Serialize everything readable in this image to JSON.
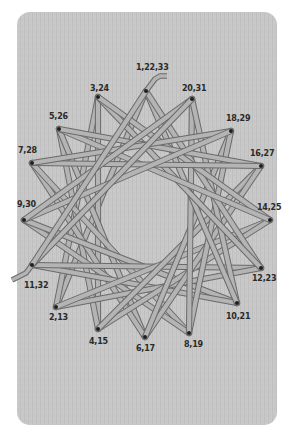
{
  "figure": {
    "colors": {
      "page_background": "#ffffff",
      "board": "#c9c9c9",
      "board_grain": "#bdbdbd",
      "string_fill": "#b4b4b4",
      "string_outline": "#6a6a6a",
      "pin": "#1e1e1e",
      "label": "#2a2a2a"
    },
    "board": {
      "x": 17,
      "y": 12,
      "width": 260,
      "height": 413,
      "radius": 13
    },
    "pins": [
      {
        "id": "P0",
        "label": "1,22,33",
        "x": 146,
        "y": 91,
        "label_x": 136,
        "label_y": 70,
        "anchor": "start"
      },
      {
        "id": "P1",
        "label": "20,31",
        "x": 192,
        "y": 99,
        "label_x": 182,
        "label_y": 91,
        "anchor": "start"
      },
      {
        "id": "P2",
        "label": "18,29",
        "x": 231,
        "y": 131,
        "label_x": 226,
        "label_y": 121,
        "anchor": "start"
      },
      {
        "id": "P3",
        "label": "16,27",
        "x": 261,
        "y": 166,
        "label_x": 250,
        "label_y": 156,
        "anchor": "start"
      },
      {
        "id": "P4",
        "label": "14,25",
        "x": 270,
        "y": 220,
        "label_x": 257,
        "label_y": 210,
        "anchor": "start"
      },
      {
        "id": "P5",
        "label": "12,23",
        "x": 261,
        "y": 268,
        "label_x": 252,
        "label_y": 281,
        "anchor": "start"
      },
      {
        "id": "P6",
        "label": "10,21",
        "x": 237,
        "y": 303,
        "label_x": 226,
        "label_y": 319,
        "anchor": "start"
      },
      {
        "id": "P7",
        "label": "8,19",
        "x": 189,
        "y": 333,
        "label_x": 184,
        "label_y": 347,
        "anchor": "start"
      },
      {
        "id": "P8",
        "label": "6,17",
        "x": 145,
        "y": 337,
        "label_x": 136,
        "label_y": 351,
        "anchor": "start"
      },
      {
        "id": "P9",
        "label": "4,15",
        "x": 98,
        "y": 329,
        "label_x": 89,
        "label_y": 344,
        "anchor": "start"
      },
      {
        "id": "P10",
        "label": "2,13",
        "x": 56,
        "y": 307,
        "label_x": 49,
        "label_y": 320,
        "anchor": "start"
      },
      {
        "id": "P11",
        "label": "11,32",
        "x": 32,
        "y": 265,
        "label_x": 24,
        "label_y": 288,
        "anchor": "start"
      },
      {
        "id": "P12",
        "label": "9,30",
        "x": 24,
        "y": 220,
        "label_x": 17,
        "label_y": 207,
        "anchor": "start"
      },
      {
        "id": "P13",
        "label": "7,28",
        "x": 32,
        "y": 163,
        "label_x": 18,
        "label_y": 153,
        "anchor": "start"
      },
      {
        "id": "P14",
        "label": "5,26",
        "x": 59,
        "y": 129,
        "label_x": 49,
        "label_y": 119,
        "anchor": "start"
      },
      {
        "id": "P15",
        "label": "3,24",
        "x": 98,
        "y": 97,
        "label_x": 90,
        "label_y": 91,
        "anchor": "start"
      }
    ],
    "string_sequence": [
      "P0",
      "P10",
      "P15",
      "P9",
      "P14",
      "P8",
      "P13",
      "P7",
      "P12",
      "P6",
      "P11",
      "P5",
      "P10",
      "P4",
      "P9",
      "P3",
      "P8",
      "P2",
      "P7",
      "P1",
      "P6",
      "P0",
      "P5",
      "P15",
      "P4",
      "P14",
      "P3",
      "P13",
      "P2",
      "P12",
      "P1",
      "P11",
      "P0"
    ],
    "string_tails": [
      {
        "name": "start-tail",
        "points": [
          [
            146,
            91
          ],
          [
            155,
            79
          ],
          [
            160,
            76
          ],
          [
            167,
            76
          ]
        ]
      },
      {
        "name": "end-tail",
        "points": [
          [
            32,
            265
          ],
          [
            26,
            273
          ],
          [
            18,
            277
          ],
          [
            12,
            280
          ]
        ]
      }
    ]
  }
}
